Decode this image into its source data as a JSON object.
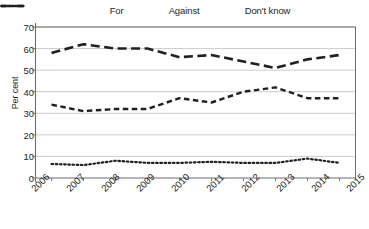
{
  "chart_data": {
    "type": "line",
    "title": "",
    "xlabel": "",
    "ylabel": "Per cent",
    "categories": [
      "2006",
      "2007",
      "2008",
      "2009",
      "2010",
      "2011",
      "2012",
      "2013",
      "2014",
      "2015"
    ],
    "ylim": [
      0,
      70
    ],
    "ytick_values": [
      0,
      10,
      20,
      30,
      40,
      50,
      60,
      70
    ],
    "grid": true,
    "legend_position": "top",
    "series": [
      {
        "name": "For",
        "style": "long-dash",
        "values": [
          58,
          62,
          60,
          60,
          56,
          57,
          54,
          51,
          55,
          57
        ]
      },
      {
        "name": "Against",
        "style": "dash",
        "values": [
          34,
          31,
          32,
          32,
          37,
          35,
          40,
          42,
          37,
          37
        ]
      },
      {
        "name": "Don't know",
        "style": "dotted",
        "values": [
          6.5,
          6,
          8,
          7,
          7,
          7.5,
          7,
          7,
          9,
          7
        ]
      }
    ]
  },
  "legend": {
    "items": [
      {
        "label": "For"
      },
      {
        "label": "Against"
      },
      {
        "label": "Don't know"
      }
    ]
  },
  "axes": {
    "y_label": "Per cent",
    "y_ticks": [
      "70",
      "60",
      "50",
      "40",
      "30",
      "20",
      "10",
      "0"
    ],
    "x_ticks": [
      "2006",
      "2007",
      "2008",
      "2009",
      "2010",
      "2011",
      "2012",
      "2013",
      "2014",
      "2015"
    ]
  },
  "colors": {
    "line": "#231f20",
    "grid": "#bfbfbf",
    "axis": "#6d6e71",
    "background": "#ffffff"
  }
}
